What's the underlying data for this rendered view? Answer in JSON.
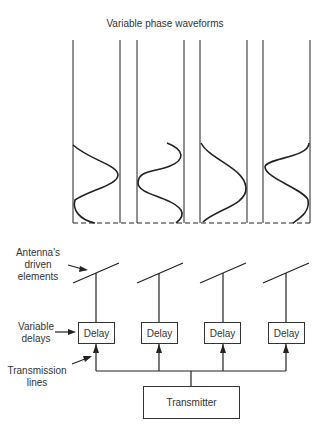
{
  "title": "Variable phase waveforms",
  "labels": {
    "antenna": "Antenna's\ndriven\nelements",
    "antenna_lines": [
      "Antenna's",
      "driven",
      "elements"
    ],
    "delays_lines": [
      "Variable",
      "delays"
    ],
    "lines_lines": [
      "Transmission",
      "lines"
    ]
  },
  "delays": [
    {
      "label": "Delay"
    },
    {
      "label": "Delay"
    },
    {
      "label": "Delay"
    },
    {
      "label": "Delay"
    }
  ],
  "transmitter": {
    "label": "Transmitter"
  }
}
